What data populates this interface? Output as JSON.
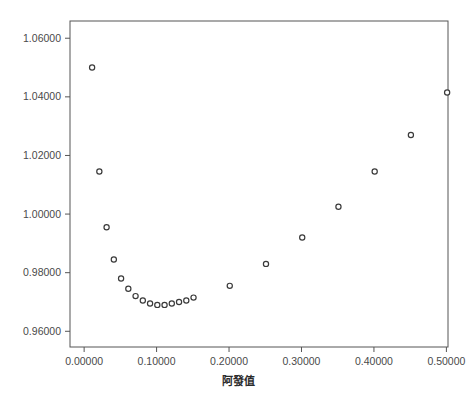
{
  "chart_data": {
    "type": "scatter",
    "title": "",
    "xlabel": "阿發值",
    "ylabel": "",
    "xlim": [
      -0.0195,
      0.5022
    ],
    "ylim": [
      0.95464,
      1.06588
    ],
    "xticks": [
      0.0,
      0.1,
      0.2,
      0.3,
      0.4,
      0.5
    ],
    "xticklabels": [
      "0.00000",
      "0.10000",
      "0.20000",
      "0.30000",
      "0.40000",
      "0.50000"
    ],
    "yticks": [
      0.96,
      0.98,
      1.0,
      1.02,
      1.04,
      1.06
    ],
    "yticklabels": [
      "0.96000",
      "0.98000",
      "1.00000",
      "1.02000",
      "1.04000",
      "1.06000"
    ],
    "grid": false,
    "legend": false,
    "marker": "open-circle",
    "marker_color": "#3a3a3a",
    "x": [
      0.011,
      0.021,
      0.031,
      0.041,
      0.051,
      0.061,
      0.071,
      0.081,
      0.091,
      0.101,
      0.111,
      0.121,
      0.131,
      0.141,
      0.151,
      0.201,
      0.251,
      0.301,
      0.351,
      0.401,
      0.451,
      0.501
    ],
    "y": [
      1.05,
      1.0145,
      0.9955,
      0.9845,
      0.978,
      0.9745,
      0.972,
      0.9705,
      0.9695,
      0.969,
      0.969,
      0.9695,
      0.97,
      0.9705,
      0.9715,
      0.9755,
      0.983,
      0.992,
      1.0025,
      1.0145,
      1.027,
      1.0415
    ]
  },
  "figure": {
    "background_color": "#ffffff",
    "frame_color": "#555555",
    "tick_label_color": "#4a4a4a",
    "axis_title_color": "#2b2b2b"
  }
}
